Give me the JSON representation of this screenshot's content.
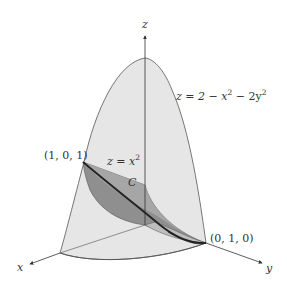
{
  "figure": {
    "axes": {
      "x_label": "x",
      "y_label": "y",
      "z_label": "z"
    },
    "surfaces": {
      "paraboloid": {
        "equation_lhs": "z = 2 − x",
        "exp1": "2",
        "mid": " − 2y",
        "exp2": "2"
      },
      "cylinder": {
        "equation_lhs": "z = x",
        "exp": "2"
      }
    },
    "curve": {
      "label": "C"
    },
    "points": {
      "p1": "(1, 0, 1)",
      "p2": "(0, 1, 0)"
    },
    "colors": {
      "surface_light": "#e4e4e4",
      "surface_dark": "#8c8c8c",
      "surface_mid": "#a9a9a9",
      "edge": "#555555",
      "curve": "#222222"
    }
  }
}
